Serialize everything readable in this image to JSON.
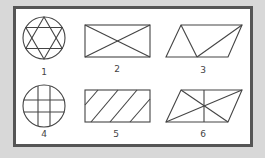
{
  "colors": {
    "background": "#d8d8d8",
    "panel": "#ffffff",
    "panel_border": "#555555",
    "stroke": "#444444"
  },
  "figures": [
    {
      "id": 1,
      "label": "1",
      "shape": "circle",
      "contents": "hexagram (star of david)"
    },
    {
      "id": 2,
      "label": "2",
      "shape": "rectangle",
      "contents": "two diagonals (X)"
    },
    {
      "id": 3,
      "label": "3",
      "shape": "parallelogram",
      "contents": "two lines forming a triangle from bottom midpoint"
    },
    {
      "id": 4,
      "label": "4",
      "shape": "circle",
      "contents": "2 vertical and 2 horizontal lines (grid)"
    },
    {
      "id": 5,
      "label": "5",
      "shape": "rectangle",
      "contents": "parallel diagonal hatching"
    },
    {
      "id": 6,
      "label": "6",
      "shape": "parallelogram",
      "contents": "two diagonals plus vertical midline"
    }
  ]
}
